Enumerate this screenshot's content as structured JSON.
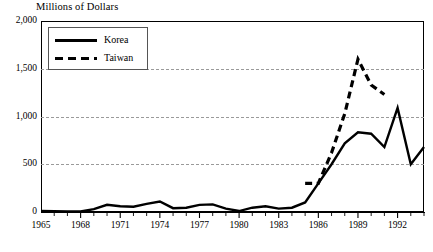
{
  "chart_data": {
    "type": "line",
    "title": "Millions of Dollars",
    "xlabel": "",
    "ylabel": "",
    "ylim": [
      0,
      2000
    ],
    "xlim": [
      1965,
      1994
    ],
    "grid": true,
    "y_ticks": [
      "0",
      "500",
      "1,000",
      "1,500",
      "2,000"
    ],
    "y_tick_values": [
      0,
      500,
      1000,
      1500,
      2000
    ],
    "x_ticks": [
      "1965",
      "1968",
      "1971",
      "1974",
      "1977",
      "1980",
      "1983",
      "1986",
      "1989",
      "1992"
    ],
    "x_tick_values": [
      1965,
      1968,
      1971,
      1974,
      1977,
      1980,
      1983,
      1986,
      1989,
      1992
    ],
    "x_minor_tick_values": [
      1966,
      1967,
      1969,
      1970,
      1972,
      1973,
      1975,
      1976,
      1978,
      1979,
      1981,
      1982,
      1984,
      1985,
      1987,
      1988,
      1990,
      1991,
      1993,
      1994
    ],
    "legend_position": "top-left",
    "series": [
      {
        "name": "Korea",
        "style": "solid",
        "color": "#000000",
        "x": [
          1965,
          1966,
          1967,
          1968,
          1969,
          1970,
          1971,
          1972,
          1973,
          1974,
          1975,
          1976,
          1977,
          1978,
          1979,
          1980,
          1981,
          1982,
          1983,
          1984,
          1985,
          1986,
          1987,
          1988,
          1989,
          1990,
          1991,
          1992,
          1993,
          1994
        ],
        "values": [
          10,
          8,
          5,
          5,
          30,
          75,
          60,
          55,
          85,
          110,
          40,
          45,
          75,
          80,
          35,
          10,
          45,
          60,
          35,
          45,
          100,
          300,
          500,
          720,
          835,
          820,
          680,
          1090,
          500,
          680
        ]
      },
      {
        "name": "Taiwan",
        "style": "dashed",
        "color": "#000000",
        "x": [
          1985,
          1986,
          1987,
          1988,
          1989,
          1990,
          1991
        ],
        "values": [
          300,
          300,
          620,
          1030,
          1600,
          1330,
          1230
        ]
      }
    ]
  },
  "legend": {
    "entries": [
      {
        "label": "Korea",
        "style": "solid"
      },
      {
        "label": "Taiwan",
        "style": "dashed"
      }
    ]
  },
  "colors": {
    "line": "#000000",
    "grid": "#9a9a9a",
    "axis": "#000000",
    "background": "#ffffff"
  }
}
